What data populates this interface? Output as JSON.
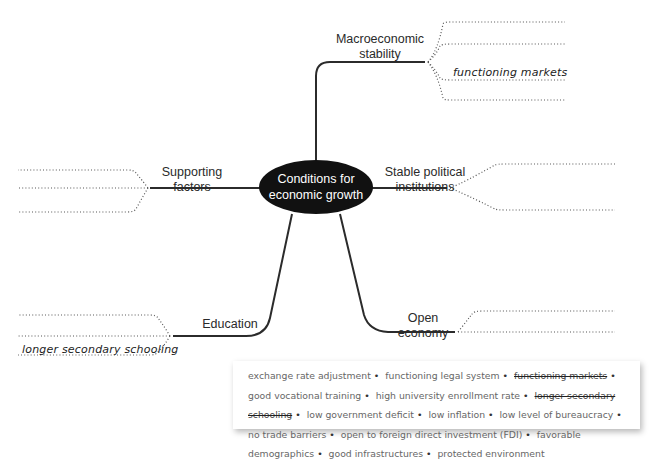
{
  "diagram": {
    "title": "Conditions for economic growth",
    "center": {
      "line1": "Conditions for",
      "line2": "economic growth"
    },
    "branches": [
      {
        "id": "macro",
        "line1": "Macroeconomic",
        "line2": "stability",
        "slots": 4,
        "filled": [
          {
            "slot": 3,
            "text": "functioning markets"
          }
        ]
      },
      {
        "id": "political",
        "line1": "Stable political",
        "line2": "institutions",
        "slots": 2,
        "filled": []
      },
      {
        "id": "supporting",
        "line1": "Supporting",
        "line2": "factors",
        "slots": 3,
        "filled": []
      },
      {
        "id": "education",
        "line1": "Education",
        "line2": "",
        "slots": 3,
        "filled": [
          {
            "slot": 3,
            "text": "longer secondary schooling"
          }
        ]
      },
      {
        "id": "open",
        "line1": "Open",
        "line2": "economy",
        "slots": 2,
        "filled": []
      }
    ]
  },
  "word_bank": {
    "items": [
      {
        "text": "exchange rate adjustment",
        "used": false
      },
      {
        "text": "functioning legal system",
        "used": false
      },
      {
        "text": "functioning markets",
        "used": true
      },
      {
        "text": "good vocational training",
        "used": false
      },
      {
        "text": "high university enrollment rate",
        "used": false
      },
      {
        "text": "longer secondary schooling",
        "used": true
      },
      {
        "text": "low government deficit",
        "used": false
      },
      {
        "text": "low inflation",
        "used": false
      },
      {
        "text": "low level of bureaucracy",
        "used": false
      },
      {
        "text": "no trade barriers",
        "used": false
      },
      {
        "text": "open to foreign direct investment (FDI)",
        "used": false
      },
      {
        "text": "favorable demographics",
        "used": false
      },
      {
        "text": "good infrastructures",
        "used": false
      },
      {
        "text": "protected environment",
        "used": false
      }
    ],
    "separator": "•"
  },
  "colors": {
    "line": "#2b2b2b",
    "center_fill": "#111111",
    "center_text": "#ffffff",
    "dotted": "#555555"
  }
}
